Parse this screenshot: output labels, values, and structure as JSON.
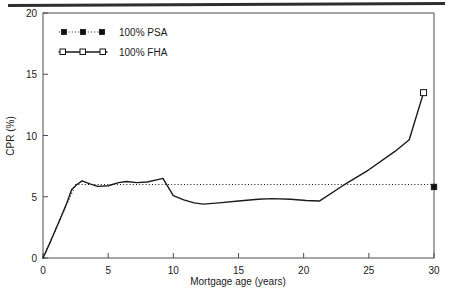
{
  "figure": {
    "divider_name": "top-rule"
  },
  "chart_data": {
    "type": "line",
    "title": "",
    "xlabel": "Mortgage age (years)",
    "ylabel": "CPR (%)",
    "xlim": [
      0,
      30
    ],
    "ylim": [
      0,
      20
    ],
    "xticks": [
      0,
      5,
      10,
      15,
      20,
      25,
      30
    ],
    "xticklabels": [
      "0",
      "5",
      "10",
      "15",
      "20",
      "25",
      "30"
    ],
    "yticks": [
      0,
      5,
      10,
      15,
      20
    ],
    "yticklabels": [
      "0",
      "5",
      "10",
      "15",
      "20"
    ],
    "grid": false,
    "legend_position": "upper-left-inside",
    "series": [
      {
        "name": "100% PSA",
        "label": "100% PSA",
        "linestyle": "dotted",
        "marker": "filled-square",
        "color": "#111111",
        "x": [
          0,
          0.5,
          1,
          1.5,
          2,
          2.5,
          3,
          5,
          10,
          15,
          20,
          25,
          30
        ],
        "y": [
          0,
          1.2,
          2.4,
          3.6,
          4.8,
          6.0,
          6.0,
          6.0,
          6.0,
          6.0,
          6.0,
          6.0,
          6.0
        ],
        "endpoint_marker": {
          "x": 30,
          "y": 5.8
        }
      },
      {
        "name": "100% FHA",
        "label": "100% FHA",
        "linestyle": "solid",
        "marker": "open-square",
        "color": "#111111",
        "x": [
          0,
          0.6,
          1.2,
          1.8,
          2.2,
          2.6,
          3.0,
          3.6,
          4.2,
          5.0,
          5.8,
          6.4,
          7.2,
          8.0,
          8.8,
          9.2,
          10.0,
          10.8,
          11.6,
          12.3,
          13.5,
          15.0,
          16.5,
          17.6,
          19.0,
          20.2,
          21.2,
          23.0,
          25.0,
          27.0,
          28.1,
          29.2
        ],
        "y": [
          0,
          1.4,
          2.9,
          4.4,
          5.6,
          6.0,
          6.3,
          6.05,
          5.85,
          5.9,
          6.15,
          6.25,
          6.15,
          6.2,
          6.4,
          6.5,
          5.1,
          4.75,
          4.5,
          4.4,
          4.5,
          4.65,
          4.8,
          4.85,
          4.8,
          4.7,
          4.65,
          5.9,
          7.2,
          8.7,
          9.65,
          13.5
        ],
        "endpoint_marker": {
          "x": 29.2,
          "y": 13.5
        }
      }
    ],
    "annotations": []
  }
}
